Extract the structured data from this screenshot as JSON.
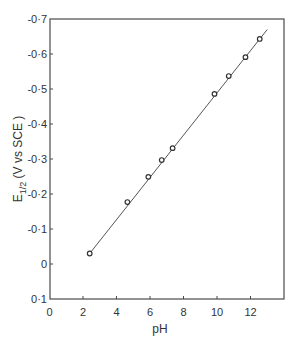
{
  "chart_data": {
    "type": "scatter",
    "title": "",
    "xlabel": "pH",
    "ylabel": "E1/2 (V vs SCE )",
    "ylabel_main": "E",
    "ylabel_sub": "1/2",
    "ylabel_rest": " (V vs SCE )",
    "xlim": [
      0,
      14
    ],
    "ylim": [
      0.1,
      -0.7
    ],
    "y_axis_inverted": true,
    "grid": false,
    "legend": null,
    "x_ticks": [
      0,
      2,
      4,
      6,
      8,
      10,
      12
    ],
    "x_tick_labels": [
      "0",
      "2",
      "4",
      "6",
      "8",
      "10",
      "12"
    ],
    "y_ticks": [
      -0.7,
      -0.6,
      -0.5,
      -0.4,
      -0.3,
      -0.2,
      -0.1,
      0,
      0.1
    ],
    "y_tick_labels": [
      "-0·7",
      "-0·6",
      "-0·5",
      "-0·4",
      "-0·3",
      "-0·2",
      "-0·1",
      "0",
      "0·1"
    ],
    "series": [
      {
        "name": "measured",
        "marker": "open-circle",
        "x": [
          2.4,
          4.65,
          5.9,
          6.7,
          7.35,
          9.85,
          10.7,
          11.7,
          12.55
        ],
        "y": [
          -0.03,
          -0.177,
          -0.249,
          -0.297,
          -0.331,
          -0.486,
          -0.537,
          -0.591,
          -0.643
        ]
      }
    ],
    "fit_line": {
      "x": [
        2.4,
        13.0
      ],
      "y": [
        -0.03,
        -0.67
      ]
    }
  }
}
